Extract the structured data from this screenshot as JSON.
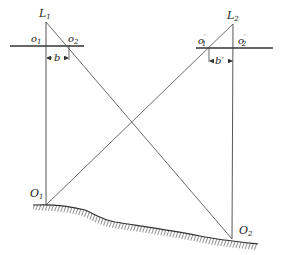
{
  "diagram": {
    "type": "stereo-photogrammetry-geometry",
    "labels": {
      "L1": {
        "main": "L",
        "sub": "1"
      },
      "L2": {
        "main": "L",
        "sub": "2"
      },
      "o1": {
        "main": "o",
        "sub": "1"
      },
      "o2": {
        "main": "o",
        "sub": "2"
      },
      "o1p": {
        "main": "o",
        "sub": "1",
        "prime": "′"
      },
      "o2p": {
        "main": "o",
        "sub": "2",
        "prime": "′"
      },
      "b": "b",
      "bp": "b′",
      "O1": {
        "main": "O",
        "sub": "1"
      },
      "O2": {
        "main": "O",
        "sub": "2"
      }
    },
    "colors": {
      "line": "#333333",
      "text": "#222222",
      "ground": "#444444"
    }
  }
}
